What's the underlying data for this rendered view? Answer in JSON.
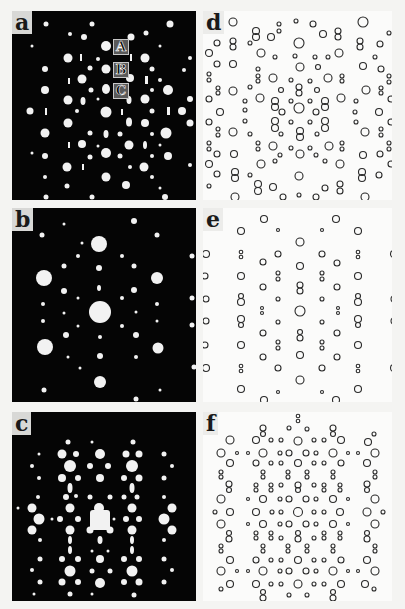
{
  "figure": {
    "panels": [
      {
        "id": "a",
        "label": "a",
        "type": "diffraction-pattern",
        "background": "#050505"
      },
      {
        "id": "b",
        "label": "b",
        "type": "diffraction-pattern",
        "background": "#050505"
      },
      {
        "id": "c",
        "label": "c",
        "type": "diffraction-pattern",
        "background": "#050505"
      },
      {
        "id": "d",
        "label": "d",
        "type": "simulated-pattern",
        "background": "#fbfbfa"
      },
      {
        "id": "e",
        "label": "e",
        "type": "simulated-pattern",
        "background": "#fbfbfa"
      },
      {
        "id": "f",
        "label": "f",
        "type": "simulated-pattern",
        "background": "#fbfbfa"
      }
    ],
    "markers": [
      {
        "label": "A"
      },
      {
        "label": "B"
      },
      {
        "label": "C"
      }
    ],
    "colors": {
      "spot": "#f2f2f2",
      "ring": "#2a2a2a",
      "page": "#f4f4f2"
    }
  }
}
